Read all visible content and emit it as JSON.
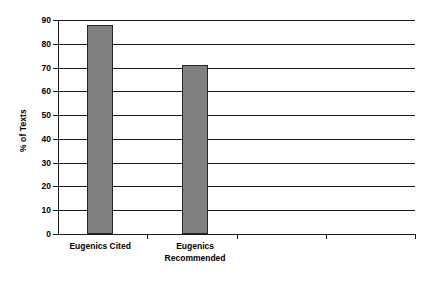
{
  "chart_data": {
    "type": "bar",
    "title": "",
    "subtitle": "",
    "xlabel": "",
    "ylabel": "% of Texts",
    "categories": [
      "Eugenics Cited",
      "Eugenics Recommended"
    ],
    "values": [
      88,
      71
    ],
    "ylim": [
      0,
      90
    ],
    "yticks": [
      0,
      10,
      20,
      30,
      40,
      50,
      60,
      70,
      80,
      90
    ],
    "ytick_labels": [
      "0",
      "10",
      "20",
      "30",
      "40",
      "50",
      "60",
      "70",
      "80",
      "90"
    ],
    "xtick_count": 4,
    "grid": "horizontal",
    "legend": "none",
    "bar_color": "#808080",
    "bar_edge_color": "#262626",
    "axis_color": "#1a1a1a",
    "background": "#ffffff",
    "series": [
      {
        "name": "% of Texts",
        "values": [
          88,
          71
        ]
      }
    ],
    "bars": [
      {
        "category": "Eugenics Cited",
        "label_lines": "Eugenics Cited",
        "value": 88,
        "center_pct": 11.8,
        "width_pct": 7.3
      },
      {
        "category": "Eugenics Recommended",
        "label_lines": "Eugenics\nRecommended",
        "value": 71,
        "center_pct": 38.4,
        "width_pct": 7.3
      }
    ]
  }
}
